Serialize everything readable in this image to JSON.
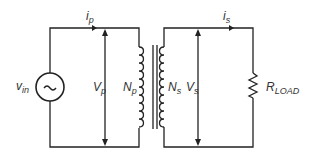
{
  "diagram": {
    "type": "transformer-circuit",
    "labels": {
      "source_main": "v",
      "source_sub": "in",
      "ip_main": "i",
      "ip_sub": "p",
      "is_main": "i",
      "is_sub": "s",
      "vp_main": "V",
      "vp_sub": "p",
      "np_main": "N",
      "np_sub": "p",
      "ns_main": "N",
      "ns_sub": "s",
      "vs_main": "V",
      "vs_sub": "s",
      "rload_main": "R",
      "rload_sub": "LOAD"
    },
    "source_symbol": "~",
    "colors": {
      "line": "#222222",
      "text": "#333333"
    }
  }
}
